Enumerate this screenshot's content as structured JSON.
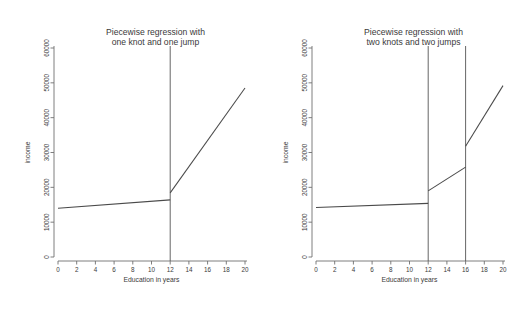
{
  "figure": {
    "background_color": "#ffffff",
    "line_color": "#4a4a4a",
    "axis_color": "#6f6f6f"
  },
  "chart_data": [
    {
      "type": "line",
      "title_line1": "Piecewise regression with",
      "title_line2": "one knot and one jump",
      "xlabel": "Education in years",
      "ylabel": "income",
      "xlim": [
        0,
        20
      ],
      "ylim": [
        0,
        60000
      ],
      "xticks": [
        0,
        2,
        4,
        6,
        8,
        10,
        12,
        14,
        16,
        18,
        20
      ],
      "xticklabels": [
        "0",
        "2",
        "4",
        "6",
        "8",
        "10",
        "12",
        "14",
        "16",
        "18",
        "20"
      ],
      "yticks": [
        0,
        10000,
        20000,
        30000,
        40000,
        50000,
        60000
      ],
      "yticklabels": [
        "0",
        "10000",
        "20000",
        "30000",
        "40000",
        "50000",
        "60000"
      ],
      "grid": false,
      "legend": "none",
      "knots": [
        12
      ],
      "knot_label": "vertical reference line at 12 years",
      "series": [
        {
          "name": "segment-before-knot",
          "x": [
            0,
            12
          ],
          "y": [
            14000,
            16400
          ]
        },
        {
          "name": "segment-after-knot",
          "x": [
            12,
            20
          ],
          "y": [
            18400,
            48500
          ]
        }
      ]
    },
    {
      "type": "line",
      "title_line1": "Piecewise regression with",
      "title_line2": "two knots and two jumps",
      "xlabel": "Education in years",
      "ylabel": "income",
      "xlim": [
        0,
        20
      ],
      "ylim": [
        0,
        60000
      ],
      "xticks": [
        0,
        2,
        4,
        6,
        8,
        10,
        12,
        14,
        16,
        18,
        20
      ],
      "xticklabels": [
        "0",
        "2",
        "4",
        "6",
        "8",
        "10",
        "12",
        "14",
        "16",
        "18",
        "20"
      ],
      "yticks": [
        0,
        10000,
        20000,
        30000,
        40000,
        50000,
        60000
      ],
      "yticklabels": [
        "0",
        "10000",
        "20000",
        "30000",
        "40000",
        "50000",
        "60000"
      ],
      "grid": false,
      "legend": "none",
      "knots": [
        12,
        16
      ],
      "knot_label": "vertical reference lines at 12 and 16 years",
      "series": [
        {
          "name": "segment-before-first-knot",
          "x": [
            0,
            12
          ],
          "y": [
            14200,
            15400
          ]
        },
        {
          "name": "segment-between-knots",
          "x": [
            12,
            16
          ],
          "y": [
            19000,
            25800
          ]
        },
        {
          "name": "segment-after-second-knot",
          "x": [
            16,
            20
          ],
          "y": [
            31800,
            49200
          ]
        }
      ]
    }
  ]
}
